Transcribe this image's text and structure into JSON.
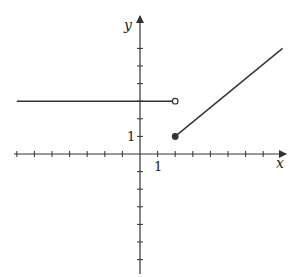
{
  "chart_data": {
    "type": "line",
    "title": "",
    "xlabel": "x",
    "ylabel": "y",
    "tick_labels": {
      "x": "1",
      "y": "1"
    },
    "xlim": [
      -7,
      8.2
    ],
    "ylim": [
      -6.7,
      7.7
    ],
    "grid": false,
    "legend": null,
    "series": [
      {
        "name": "left piece",
        "description": "constant y = 3 for x < 2",
        "points": [
          [
            -7,
            3
          ],
          [
            2,
            3
          ]
        ],
        "left_end": "arrow-free (extends to edge)",
        "right_end": "open circle"
      },
      {
        "name": "right piece",
        "description": "line from (2,1) rising with slope ~0.8",
        "points": [
          [
            2,
            1
          ],
          [
            8.1,
            6
          ]
        ],
        "left_end": "closed dot",
        "right_end": "continues to edge"
      }
    ],
    "markers": [
      {
        "x": 2,
        "y": 3,
        "style": "open"
      },
      {
        "x": 2,
        "y": 1,
        "style": "closed"
      }
    ],
    "x_ticks": [
      -7,
      -6,
      -5,
      -4,
      -3,
      -2,
      -1,
      1,
      2,
      3,
      4,
      5,
      6,
      7
    ],
    "y_ticks": [
      -6,
      -5,
      -4,
      -3,
      -2,
      -1,
      1,
      2,
      3,
      4,
      5,
      6
    ]
  },
  "colors": {
    "axis": "#333333",
    "curve": "#333333",
    "background": "#ffffff"
  }
}
